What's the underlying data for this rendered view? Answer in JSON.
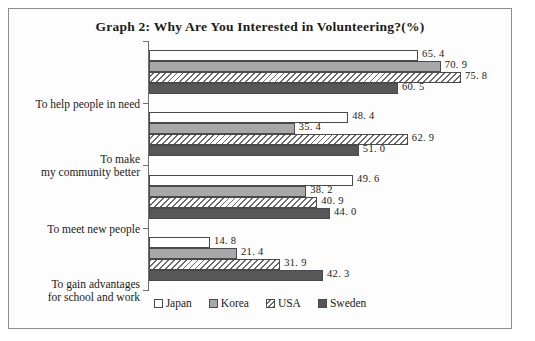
{
  "chart_data": {
    "type": "bar",
    "orientation": "horizontal",
    "title": "Graph 2: Why Are You Interested in Volunteering?(%)",
    "xlabel": "",
    "ylabel": "",
    "unit": "%",
    "xlim": [
      0,
      80
    ],
    "grid": false,
    "legend_position": "bottom-center",
    "categories": [
      "To help people in need",
      "To make\nmy community better",
      "To meet new people",
      "To gain advantages\nfor school and work"
    ],
    "series": [
      {
        "name": "Japan",
        "color": "#ffffff",
        "pattern": "solid",
        "values": [
          65.4,
          48.4,
          49.6,
          14.8
        ]
      },
      {
        "name": "Korea",
        "color": "#a8a8a8",
        "pattern": "solid",
        "values": [
          70.9,
          35.4,
          38.2,
          21.4
        ]
      },
      {
        "name": "USA",
        "color": "#ffffff",
        "pattern": "hatch",
        "values": [
          75.8,
          62.9,
          40.9,
          31.9
        ]
      },
      {
        "name": "Sweden",
        "color": "#575757",
        "pattern": "solid",
        "values": [
          60.5,
          51.0,
          44.0,
          42.3
        ]
      }
    ],
    "value_labels": [
      [
        "65. 4",
        "70. 9",
        "75. 8",
        "60. 5"
      ],
      [
        "48. 4",
        "35. 4",
        "62. 9",
        "51. 0"
      ],
      [
        "49. 6",
        "38. 2",
        "40. 9",
        "44. 0"
      ],
      [
        "14. 8",
        "21. 4",
        "31. 9",
        "42. 3"
      ]
    ]
  },
  "legend": {
    "items": [
      {
        "label": "Japan"
      },
      {
        "label": "Korea"
      },
      {
        "label": "USA"
      },
      {
        "label": "Sweden"
      }
    ]
  }
}
